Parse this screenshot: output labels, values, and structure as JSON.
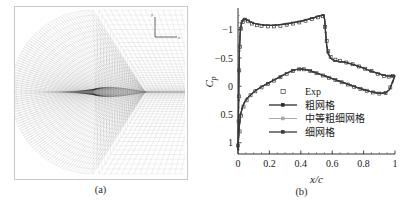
{
  "figure": {
    "panel_a": {
      "caption": "(a)",
      "description": "C-type structured computational grid around airfoil",
      "axis_indicator": {
        "x_label": "x",
        "y_label": "y"
      }
    },
    "panel_b": {
      "caption": "(b)"
    }
  },
  "chart_data": {
    "type": "line",
    "title": "",
    "xlabel": "x/c",
    "ylabel": "Cp",
    "xlim": [
      0,
      1
    ],
    "ylim": [
      1.2,
      -1.35
    ],
    "y_inverted": true,
    "grid": false,
    "xticks": [
      0,
      0.2,
      0.4,
      0.6,
      0.8,
      1
    ],
    "xticklabels": [
      "0",
      "0.2",
      "0.4",
      "0.6",
      "0.8",
      "1"
    ],
    "yticks": [
      -1,
      -0.5,
      0,
      0.5,
      1
    ],
    "yticklabels": [
      "−1",
      "−0.5",
      "0",
      "0.5",
      "1"
    ],
    "legend_position": "center",
    "legend": [
      {
        "label": "Exp",
        "marker": "open-square",
        "line": "none",
        "color": "#3c3c3c"
      },
      {
        "label": "粗网格",
        "marker": "filled-square",
        "line": "solid",
        "color": "#2a2a2a"
      },
      {
        "label": "中等粗细网格",
        "marker": "filled-square",
        "line": "solid",
        "color": "#a9a9a9"
      },
      {
        "label": "细网格",
        "marker": "filled-square",
        "line": "solid",
        "color": "#3a3a3a"
      }
    ],
    "series": [
      {
        "name": "Exp",
        "style": "markers",
        "points": [
          [
            0.0,
            1.05
          ],
          [
            0.004,
            0.62
          ],
          [
            0.006,
            0.18
          ],
          [
            0.008,
            -0.28
          ],
          [
            0.012,
            -0.7
          ],
          [
            0.018,
            -1.02
          ],
          [
            0.03,
            -1.14
          ],
          [
            0.045,
            -1.18
          ],
          [
            0.065,
            -1.15
          ],
          [
            0.09,
            -1.11
          ],
          [
            0.12,
            -1.08
          ],
          [
            0.15,
            -1.07
          ],
          [
            0.19,
            -1.06
          ],
          [
            0.23,
            -1.06
          ],
          [
            0.27,
            -1.07
          ],
          [
            0.31,
            -1.09
          ],
          [
            0.35,
            -1.11
          ],
          [
            0.39,
            -1.13
          ],
          [
            0.43,
            -1.16
          ],
          [
            0.47,
            -1.19
          ],
          [
            0.51,
            -1.22
          ],
          [
            0.54,
            -1.24
          ],
          [
            0.555,
            -1.05
          ],
          [
            0.565,
            -0.8
          ],
          [
            0.575,
            -0.62
          ],
          [
            0.59,
            -0.52
          ],
          [
            0.62,
            -0.47
          ],
          [
            0.65,
            -0.45
          ],
          [
            0.69,
            -0.42
          ],
          [
            0.73,
            -0.39
          ],
          [
            0.77,
            -0.35
          ],
          [
            0.81,
            -0.31
          ],
          [
            0.85,
            -0.27
          ],
          [
            0.89,
            -0.22
          ],
          [
            0.93,
            -0.18
          ],
          [
            0.96,
            -0.17
          ],
          [
            0.985,
            -0.18
          ],
          [
            0.01,
            0.8
          ],
          [
            0.02,
            0.52
          ],
          [
            0.035,
            0.36
          ],
          [
            0.055,
            0.25
          ],
          [
            0.08,
            0.16
          ],
          [
            0.11,
            0.09
          ],
          [
            0.15,
            0.02
          ],
          [
            0.19,
            -0.04
          ],
          [
            0.23,
            -0.1
          ],
          [
            0.27,
            -0.16
          ],
          [
            0.31,
            -0.22
          ],
          [
            0.35,
            -0.27
          ],
          [
            0.39,
            -0.3
          ],
          [
            0.42,
            -0.3
          ],
          [
            0.46,
            -0.27
          ],
          [
            0.5,
            -0.23
          ],
          [
            0.54,
            -0.19
          ],
          [
            0.58,
            -0.15
          ],
          [
            0.62,
            -0.11
          ],
          [
            0.66,
            -0.07
          ],
          [
            0.7,
            -0.03
          ],
          [
            0.74,
            0.01
          ],
          [
            0.78,
            0.05
          ],
          [
            0.82,
            0.08
          ],
          [
            0.86,
            0.11
          ],
          [
            0.9,
            0.13
          ],
          [
            0.94,
            0.12
          ],
          [
            0.97,
            0.02
          ]
        ]
      },
      {
        "name": "粗网格",
        "style": "line",
        "upper": [
          [
            0.0,
            1.12
          ],
          [
            0.002,
            0.7
          ],
          [
            0.004,
            0.25
          ],
          [
            0.006,
            -0.2
          ],
          [
            0.009,
            -0.62
          ],
          [
            0.014,
            -0.95
          ],
          [
            0.022,
            -1.12
          ],
          [
            0.034,
            -1.19
          ],
          [
            0.05,
            -1.185
          ],
          [
            0.07,
            -1.155
          ],
          [
            0.095,
            -1.12
          ],
          [
            0.125,
            -1.1
          ],
          [
            0.16,
            -1.085
          ],
          [
            0.2,
            -1.08
          ],
          [
            0.24,
            -1.08
          ],
          [
            0.28,
            -1.095
          ],
          [
            0.32,
            -1.11
          ],
          [
            0.36,
            -1.13
          ],
          [
            0.4,
            -1.15
          ],
          [
            0.44,
            -1.18
          ],
          [
            0.48,
            -1.21
          ],
          [
            0.52,
            -1.245
          ],
          [
            0.545,
            -1.26
          ],
          [
            0.552,
            -1.18
          ],
          [
            0.558,
            -0.95
          ],
          [
            0.565,
            -0.72
          ],
          [
            0.575,
            -0.58
          ],
          [
            0.59,
            -0.5
          ],
          [
            0.61,
            -0.455
          ],
          [
            0.64,
            -0.44
          ],
          [
            0.68,
            -0.425
          ],
          [
            0.72,
            -0.395
          ],
          [
            0.76,
            -0.36
          ],
          [
            0.8,
            -0.32
          ],
          [
            0.84,
            -0.275
          ],
          [
            0.88,
            -0.235
          ],
          [
            0.92,
            -0.2
          ],
          [
            0.95,
            -0.185
          ],
          [
            0.98,
            -0.18
          ],
          [
            1.0,
            -0.19
          ]
        ],
        "lower": [
          [
            0.0,
            1.12
          ],
          [
            0.003,
            0.95
          ],
          [
            0.008,
            0.72
          ],
          [
            0.015,
            0.53
          ],
          [
            0.025,
            0.4
          ],
          [
            0.04,
            0.29
          ],
          [
            0.06,
            0.21
          ],
          [
            0.085,
            0.14
          ],
          [
            0.115,
            0.07
          ],
          [
            0.15,
            0.01
          ],
          [
            0.19,
            -0.05
          ],
          [
            0.23,
            -0.11
          ],
          [
            0.27,
            -0.17
          ],
          [
            0.31,
            -0.23
          ],
          [
            0.35,
            -0.28
          ],
          [
            0.385,
            -0.305
          ],
          [
            0.41,
            -0.305
          ],
          [
            0.44,
            -0.29
          ],
          [
            0.48,
            -0.255
          ],
          [
            0.52,
            -0.215
          ],
          [
            0.56,
            -0.175
          ],
          [
            0.6,
            -0.135
          ],
          [
            0.64,
            -0.095
          ],
          [
            0.68,
            -0.055
          ],
          [
            0.72,
            -0.015
          ],
          [
            0.76,
            0.025
          ],
          [
            0.8,
            0.06
          ],
          [
            0.84,
            0.09
          ],
          [
            0.88,
            0.115
          ],
          [
            0.91,
            0.125
          ],
          [
            0.94,
            0.115
          ],
          [
            0.965,
            0.06
          ],
          [
            0.985,
            -0.08
          ],
          [
            1.0,
            -0.19
          ]
        ]
      },
      {
        "name": "中等粗细网格",
        "style": "line",
        "upper": [
          [
            0.0,
            1.12
          ],
          [
            0.002,
            0.7
          ],
          [
            0.004,
            0.25
          ],
          [
            0.006,
            -0.2
          ],
          [
            0.009,
            -0.62
          ],
          [
            0.014,
            -0.95
          ],
          [
            0.022,
            -1.12
          ],
          [
            0.034,
            -1.19
          ],
          [
            0.05,
            -1.185
          ],
          [
            0.07,
            -1.155
          ],
          [
            0.095,
            -1.12
          ],
          [
            0.125,
            -1.1
          ],
          [
            0.16,
            -1.085
          ],
          [
            0.2,
            -1.08
          ],
          [
            0.24,
            -1.08
          ],
          [
            0.28,
            -1.095
          ],
          [
            0.32,
            -1.11
          ],
          [
            0.36,
            -1.13
          ],
          [
            0.4,
            -1.15
          ],
          [
            0.44,
            -1.18
          ],
          [
            0.48,
            -1.21
          ],
          [
            0.52,
            -1.245
          ],
          [
            0.545,
            -1.26
          ],
          [
            0.552,
            -1.18
          ],
          [
            0.558,
            -0.95
          ],
          [
            0.565,
            -0.72
          ],
          [
            0.575,
            -0.58
          ],
          [
            0.59,
            -0.5
          ],
          [
            0.61,
            -0.455
          ],
          [
            0.64,
            -0.44
          ],
          [
            0.68,
            -0.425
          ],
          [
            0.72,
            -0.395
          ],
          [
            0.76,
            -0.36
          ],
          [
            0.8,
            -0.32
          ],
          [
            0.84,
            -0.275
          ],
          [
            0.88,
            -0.235
          ],
          [
            0.92,
            -0.2
          ],
          [
            0.95,
            -0.185
          ],
          [
            0.98,
            -0.18
          ],
          [
            1.0,
            -0.19
          ]
        ],
        "lower": [
          [
            0.0,
            1.12
          ],
          [
            0.003,
            0.95
          ],
          [
            0.008,
            0.72
          ],
          [
            0.015,
            0.53
          ],
          [
            0.025,
            0.4
          ],
          [
            0.04,
            0.29
          ],
          [
            0.06,
            0.21
          ],
          [
            0.085,
            0.14
          ],
          [
            0.115,
            0.07
          ],
          [
            0.15,
            0.01
          ],
          [
            0.19,
            -0.05
          ],
          [
            0.23,
            -0.11
          ],
          [
            0.27,
            -0.17
          ],
          [
            0.31,
            -0.23
          ],
          [
            0.35,
            -0.28
          ],
          [
            0.385,
            -0.305
          ],
          [
            0.41,
            -0.305
          ],
          [
            0.44,
            -0.29
          ],
          [
            0.48,
            -0.255
          ],
          [
            0.52,
            -0.215
          ],
          [
            0.56,
            -0.175
          ],
          [
            0.6,
            -0.135
          ],
          [
            0.64,
            -0.095
          ],
          [
            0.68,
            -0.055
          ],
          [
            0.72,
            -0.015
          ],
          [
            0.76,
            0.025
          ],
          [
            0.8,
            0.06
          ],
          [
            0.84,
            0.09
          ],
          [
            0.88,
            0.115
          ],
          [
            0.91,
            0.125
          ],
          [
            0.94,
            0.115
          ],
          [
            0.965,
            0.06
          ],
          [
            0.985,
            -0.08
          ],
          [
            1.0,
            -0.19
          ]
        ]
      },
      {
        "name": "细网格",
        "style": "line",
        "upper": [
          [
            0.0,
            1.12
          ],
          [
            0.002,
            0.7
          ],
          [
            0.004,
            0.25
          ],
          [
            0.006,
            -0.2
          ],
          [
            0.009,
            -0.62
          ],
          [
            0.014,
            -0.95
          ],
          [
            0.022,
            -1.12
          ],
          [
            0.034,
            -1.19
          ],
          [
            0.05,
            -1.185
          ],
          [
            0.07,
            -1.155
          ],
          [
            0.095,
            -1.12
          ],
          [
            0.125,
            -1.1
          ],
          [
            0.16,
            -1.085
          ],
          [
            0.2,
            -1.08
          ],
          [
            0.24,
            -1.08
          ],
          [
            0.28,
            -1.095
          ],
          [
            0.32,
            -1.11
          ],
          [
            0.36,
            -1.13
          ],
          [
            0.4,
            -1.15
          ],
          [
            0.44,
            -1.18
          ],
          [
            0.48,
            -1.21
          ],
          [
            0.52,
            -1.245
          ],
          [
            0.545,
            -1.26
          ],
          [
            0.552,
            -1.18
          ],
          [
            0.558,
            -0.95
          ],
          [
            0.565,
            -0.72
          ],
          [
            0.575,
            -0.58
          ],
          [
            0.59,
            -0.5
          ],
          [
            0.61,
            -0.455
          ],
          [
            0.64,
            -0.44
          ],
          [
            0.68,
            -0.425
          ],
          [
            0.72,
            -0.395
          ],
          [
            0.76,
            -0.36
          ],
          [
            0.8,
            -0.32
          ],
          [
            0.84,
            -0.275
          ],
          [
            0.88,
            -0.235
          ],
          [
            0.92,
            -0.2
          ],
          [
            0.95,
            -0.185
          ],
          [
            0.98,
            -0.18
          ],
          [
            1.0,
            -0.19
          ]
        ],
        "lower": [
          [
            0.0,
            1.12
          ],
          [
            0.003,
            0.95
          ],
          [
            0.008,
            0.72
          ],
          [
            0.015,
            0.53
          ],
          [
            0.025,
            0.4
          ],
          [
            0.04,
            0.29
          ],
          [
            0.06,
            0.21
          ],
          [
            0.085,
            0.14
          ],
          [
            0.115,
            0.07
          ],
          [
            0.15,
            0.01
          ],
          [
            0.19,
            -0.05
          ],
          [
            0.23,
            -0.11
          ],
          [
            0.27,
            -0.17
          ],
          [
            0.31,
            -0.23
          ],
          [
            0.35,
            -0.28
          ],
          [
            0.385,
            -0.305
          ],
          [
            0.41,
            -0.305
          ],
          [
            0.44,
            -0.29
          ],
          [
            0.48,
            -0.255
          ],
          [
            0.52,
            -0.215
          ],
          [
            0.56,
            -0.175
          ],
          [
            0.6,
            -0.135
          ],
          [
            0.64,
            -0.095
          ],
          [
            0.68,
            -0.055
          ],
          [
            0.72,
            -0.015
          ],
          [
            0.76,
            0.025
          ],
          [
            0.8,
            0.06
          ],
          [
            0.84,
            0.09
          ],
          [
            0.88,
            0.115
          ],
          [
            0.91,
            0.125
          ],
          [
            0.94,
            0.115
          ],
          [
            0.965,
            0.06
          ],
          [
            0.985,
            -0.08
          ],
          [
            1.0,
            -0.19
          ]
        ]
      }
    ]
  }
}
